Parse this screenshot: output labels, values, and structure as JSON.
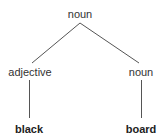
{
  "diagram": {
    "type": "parse-tree",
    "nodes": [
      {
        "id": "root",
        "label": "noun",
        "x": 80,
        "y": 8,
        "kind": "category"
      },
      {
        "id": "adj",
        "label": "adjective",
        "x": 30,
        "y": 66,
        "kind": "category"
      },
      {
        "id": "n2",
        "label": "noun",
        "x": 141,
        "y": 66,
        "kind": "category"
      },
      {
        "id": "w1",
        "label": "black",
        "x": 29,
        "y": 123,
        "kind": "word"
      },
      {
        "id": "w2",
        "label": "board",
        "x": 141,
        "y": 123,
        "kind": "word"
      }
    ],
    "edges": [
      {
        "from": "root",
        "to": "adj"
      },
      {
        "from": "root",
        "to": "n2"
      },
      {
        "from": "adj",
        "to": "w1"
      },
      {
        "from": "n2",
        "to": "w2"
      }
    ],
    "line_color": "#555555"
  }
}
